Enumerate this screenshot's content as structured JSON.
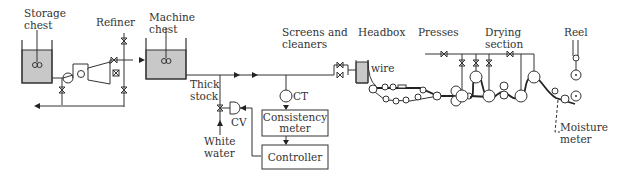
{
  "labels": {
    "storage_chest": [
      "Storage",
      "chest"
    ],
    "refiner": "Refiner",
    "machine_chest": [
      "Machine",
      "chest"
    ],
    "thick_stock": [
      "Thick",
      "stock"
    ],
    "white_water": [
      "White",
      "water"
    ],
    "cv": "CV",
    "ct": "CT",
    "screens_cleaners": [
      "Screens and",
      "cleaners"
    ],
    "headbox": "Headbox",
    "wire": "wire",
    "presses": "Presses",
    "drying_section": [
      "Drying",
      "section"
    ],
    "reel": "Reel",
    "moisture_meter": [
      "Moisture",
      "meter"
    ],
    "consistency_meter": [
      "Consistency",
      "meter"
    ],
    "controller": "Controller"
  },
  "colors": {
    "line": "#333333",
    "liquid": "#c8c8c8",
    "background": "#ffffff"
  }
}
